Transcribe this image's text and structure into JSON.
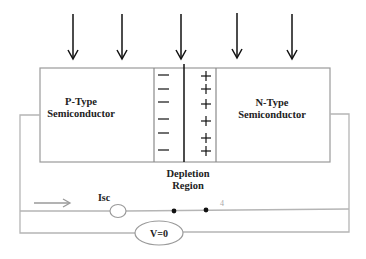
{
  "diagram": {
    "title": "",
    "light_arrows": {
      "count": 5,
      "xs": [
        73,
        122,
        181,
        237,
        292
      ],
      "y_top": 14,
      "y_bottom": 60
    },
    "regions": {
      "p_type": {
        "line1": "P-Type",
        "line2": "Semiconductor"
      },
      "n_type": {
        "line1": "N-Type",
        "line2": "Semiconductor"
      },
      "depletion": {
        "line1": "Depletion",
        "line2": "Region",
        "negative_charges": [
          "−",
          "−",
          "−",
          "−",
          "−",
          "−"
        ],
        "positive_charges": [
          "+",
          "+",
          "+",
          "+",
          "+",
          "+"
        ]
      }
    },
    "circuit": {
      "current_label": "Isc",
      "meter_label": "V=0",
      "node_marker": "4",
      "current_direction": "right"
    },
    "colors": {
      "arrow": "#111111",
      "box_outline": "#9a9a9a",
      "junction_line": "#111111",
      "wire": "#b5b5b5",
      "flow_arrow": "#9a9a9a",
      "node_dot": "#111111"
    }
  }
}
